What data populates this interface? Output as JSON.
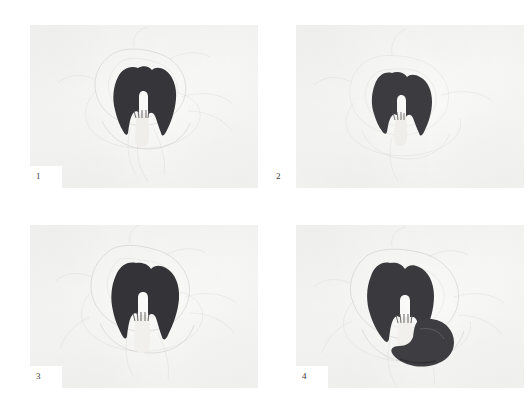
{
  "figure": {
    "type": "photographic-plate-grid",
    "layout": {
      "rows": 2,
      "columns": 4,
      "panel_count": 4
    },
    "background_color": "#ffffff",
    "plate_color": "#f6f6f4",
    "specimen_color": "#333337",
    "specimen_highlight_color": "#f2f0ec",
    "sketch_line_color": "#c9c7c4",
    "caption_color": "#3a3a3a"
  },
  "panels": [
    {
      "id": "panel-1",
      "caption": "1",
      "caption_placement": "notch",
      "description": "Dark flower specimen, single petal mass with pale central column",
      "specimen": {
        "count": 1,
        "shape": "single-dark-petal-mass",
        "position": {
          "cx": 52,
          "cy": 42
        },
        "size": {
          "w": 21,
          "h": 27
        }
      }
    },
    {
      "id": "panel-2",
      "caption": "2",
      "caption_placement": "outside",
      "description": "Dark flower specimen, smaller, slightly rotated, pale column visible",
      "specimen": {
        "count": 1,
        "shape": "single-dark-petal-mass",
        "position": {
          "cx": 47,
          "cy": 44
        },
        "size": {
          "w": 19,
          "h": 24
        }
      }
    },
    {
      "id": "panel-3",
      "caption": "3",
      "caption_placement": "notch",
      "description": "Dark flower specimen, broad petal mass with prominent pale central column",
      "specimen": {
        "count": 1,
        "shape": "single-dark-petal-mass",
        "position": {
          "cx": 51,
          "cy": 43
        },
        "size": {
          "w": 22,
          "h": 27
        }
      }
    },
    {
      "id": "panel-4",
      "caption": "4",
      "caption_placement": "notch",
      "description": "Dark flower specimen with a second detached petal lobe to the lower right",
      "specimen": {
        "count": 2,
        "shape": "dark-petal-mass-plus-detached-lobe",
        "position": {
          "cx": 48,
          "cy": 42
        },
        "size": {
          "w": 30,
          "h": 28
        }
      }
    }
  ]
}
